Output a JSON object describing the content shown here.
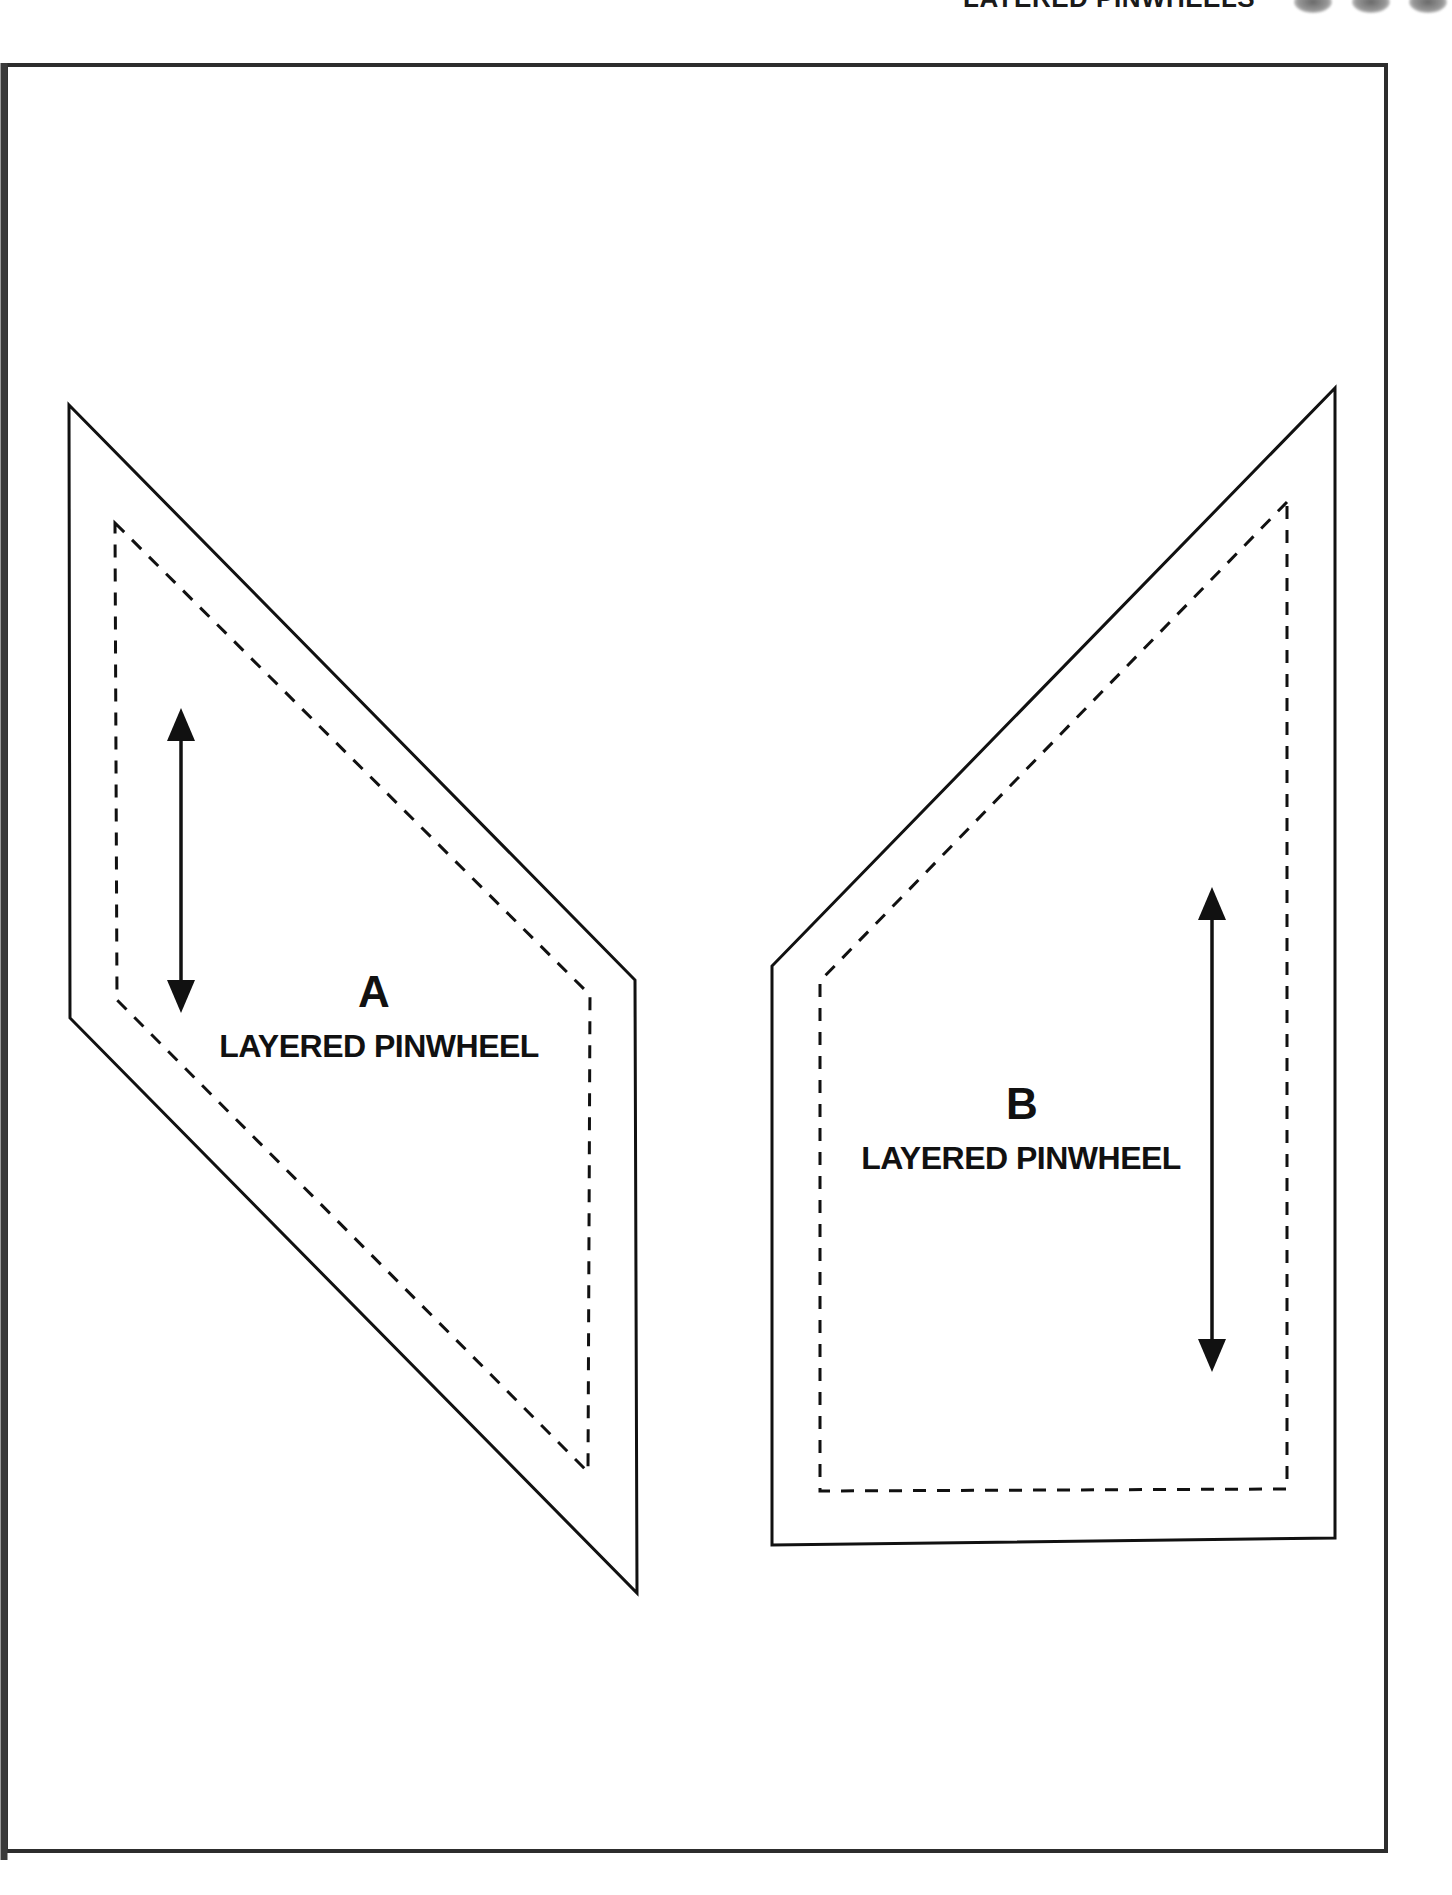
{
  "header": {
    "title": "LAYERED PINWHEELS",
    "icons": [
      {
        "name": "pinwheel-thumbnail"
      },
      {
        "name": "pinwheel-thumbnail"
      },
      {
        "name": "pinwheel-thumbnail"
      }
    ]
  },
  "templates": [
    {
      "letter": "A",
      "name": "LAYERED PINWHEEL",
      "cut_line": "solid",
      "seam_line": "dashed",
      "grainline_arrow": "vertical-double-headed"
    },
    {
      "letter": "B",
      "name": "LAYERED PINWHEEL",
      "cut_line": "solid",
      "seam_line": "dashed",
      "grainline_arrow": "vertical-double-headed"
    }
  ],
  "colors": {
    "line": "#111111",
    "frame": "#2d2d2d",
    "background": "#ffffff"
  }
}
